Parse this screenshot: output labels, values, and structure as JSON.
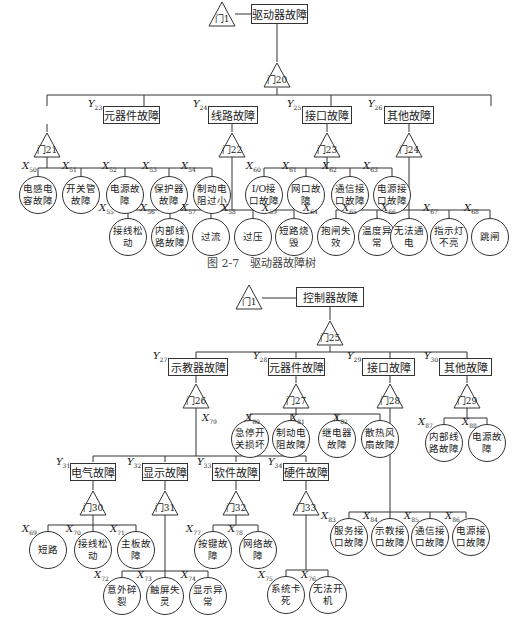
{
  "figure1": {
    "caption": "图 2-7　驱动器故障树",
    "top_event": "驱动器故障",
    "top_gate": "门1",
    "main_gate": "门20",
    "intermediate": [
      {
        "id": "Y",
        "sub": "23",
        "label": "元器件故障",
        "gate": "门21"
      },
      {
        "id": "Y",
        "sub": "24",
        "label": "线路故障",
        "gate": "门22"
      },
      {
        "id": "Y",
        "sub": "25",
        "label": "接口故障",
        "gate": "门23"
      },
      {
        "id": "Y",
        "sub": "26",
        "label": "其他故障",
        "gate": "门24"
      }
    ],
    "basic_events": [
      {
        "sub": "50",
        "label": "电感电容故障"
      },
      {
        "sub": "51",
        "label": "开关管故障"
      },
      {
        "sub": "52",
        "label": "电源故障"
      },
      {
        "sub": "53",
        "label": "保护器故障"
      },
      {
        "sub": "54",
        "label": "制动电阻过小"
      },
      {
        "sub": "55",
        "label": "接线松动"
      },
      {
        "sub": "56",
        "label": "内部线路故障"
      },
      {
        "sub": "57",
        "label": "过流"
      },
      {
        "sub": "58",
        "label": "过压"
      },
      {
        "sub": "59",
        "label": "短路烧毁"
      },
      {
        "sub": "60",
        "label": "I/O接口故障"
      },
      {
        "sub": "61",
        "label": "网口故障"
      },
      {
        "sub": "62",
        "label": "通信接口故障"
      },
      {
        "sub": "63",
        "label": "电源接口故障"
      },
      {
        "sub": "64",
        "label": "抱闸失效"
      },
      {
        "sub": "65",
        "label": "温度异常"
      },
      {
        "sub": "66",
        "label": "无法通电"
      },
      {
        "sub": "67",
        "label": "指示灯不亮"
      },
      {
        "sub": "68",
        "label": "跳闸"
      }
    ]
  },
  "figure2": {
    "top_event": "控制器故障",
    "top_gate": "门1",
    "main_gate": "门25",
    "intermediate": [
      {
        "id": "Y",
        "sub": "27",
        "label": "示教器故障",
        "gate": "门26"
      },
      {
        "id": "Y",
        "sub": "28",
        "label": "元器件故障",
        "gate": "门27"
      },
      {
        "id": "Y",
        "sub": "29",
        "label": "接口故障",
        "gate": "门28"
      },
      {
        "id": "Y",
        "sub": "30",
        "label": "其他故障",
        "gate": "门29"
      },
      {
        "id": "Y",
        "sub": "31",
        "label": "电气故障",
        "gate": "门30"
      },
      {
        "id": "Y",
        "sub": "32",
        "label": "显示故障",
        "gate": "门31"
      },
      {
        "id": "Y",
        "sub": "33",
        "label": "软件故障",
        "gate": "门32"
      },
      {
        "id": "Y",
        "sub": "34",
        "label": "硬件故障",
        "gate": "门33"
      }
    ],
    "basic_events": [
      {
        "sub": "69",
        "label": "短路"
      },
      {
        "sub": "70",
        "label": "接线松动"
      },
      {
        "sub": "71",
        "label": "主板故障"
      },
      {
        "sub": "72",
        "label": "意外碎裂"
      },
      {
        "sub": "73",
        "label": "触屏失灵"
      },
      {
        "sub": "74",
        "label": "显示异常"
      },
      {
        "sub": "75",
        "label": "系统卡死"
      },
      {
        "sub": "76",
        "label": "无法开机"
      },
      {
        "sub": "77",
        "label": "按键故障"
      },
      {
        "sub": "78",
        "label": "网络故障"
      },
      {
        "sub": "79",
        "label": "急停开关损坏"
      },
      {
        "sub": "80",
        "label": "制动电阻故障"
      },
      {
        "sub": "81",
        "label": "继电器故障"
      },
      {
        "sub": "82",
        "label": "散热风扇故障"
      },
      {
        "sub": "83",
        "label": "服务接口故障"
      },
      {
        "sub": "84",
        "label": "示教接口故障"
      },
      {
        "sub": "85",
        "label": "通信接口故障"
      },
      {
        "sub": "86",
        "label": "电源接口故障"
      },
      {
        "sub": "87",
        "label": "内部线路故障"
      },
      {
        "sub": "88",
        "label": "电源故障"
      }
    ]
  }
}
